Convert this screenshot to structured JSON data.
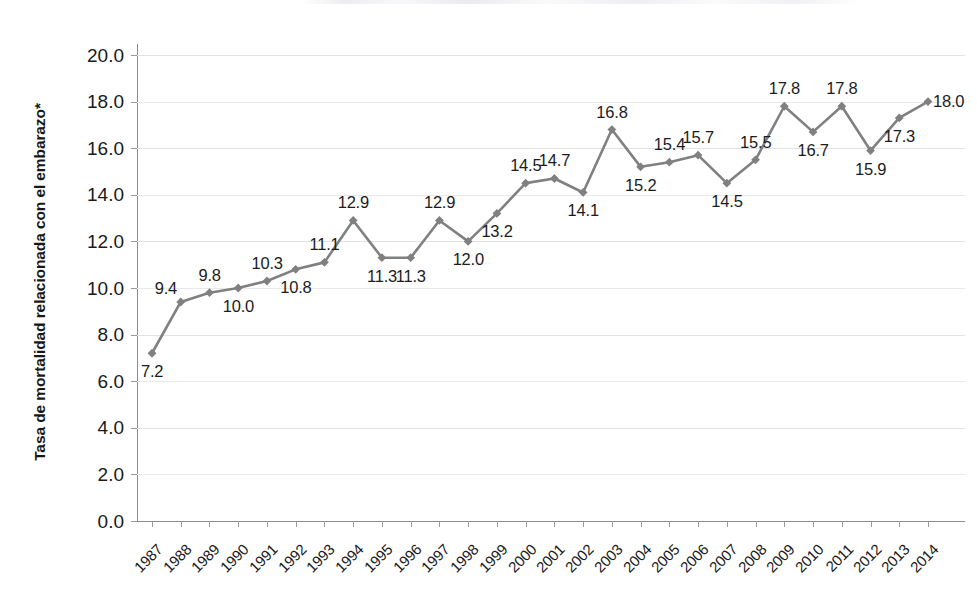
{
  "chart_data": {
    "type": "line",
    "title": "",
    "xlabel": "",
    "ylabel": "Tasa de mortalidad relacionada con el embarazo*",
    "ylim": [
      0.0,
      20.0
    ],
    "ytick_step": 2.0,
    "grid": true,
    "legend": "none",
    "marker": "diamond",
    "series_color": "#808080",
    "label_color": "#1c1c1c",
    "gridline_color": "#e9e9ec",
    "axis_color": "#8c8c8c",
    "categories": [
      "1987",
      "1988",
      "1989",
      "1990",
      "1991",
      "1992",
      "1993",
      "1994",
      "1995",
      "1996",
      "1997",
      "1998",
      "1999",
      "2000",
      "2001",
      "2002",
      "2003",
      "2004",
      "2005",
      "2006",
      "2007",
      "2008",
      "2009",
      "2010",
      "2011",
      "2012",
      "2013",
      "2014"
    ],
    "values": [
      7.2,
      9.4,
      9.8,
      10.0,
      10.3,
      10.8,
      11.1,
      12.9,
      11.3,
      11.3,
      12.9,
      12.0,
      13.2,
      14.5,
      14.7,
      14.1,
      16.8,
      15.2,
      15.4,
      15.7,
      14.5,
      15.5,
      17.8,
      16.7,
      17.8,
      15.9,
      17.3,
      18.0
    ],
    "value_labels": [
      "7.2",
      "9.4",
      "9.8",
      "10.0",
      "10.3",
      "10.8",
      "11.1",
      "12.9",
      "11.3",
      "11.3",
      "12.9",
      "12.0",
      "13.2",
      "14.5",
      "14.7",
      "14.1",
      "16.8",
      "15.2",
      "15.4",
      "15.7",
      "14.5",
      "15.5",
      "17.8",
      "16.7",
      "17.8",
      "15.9",
      "17.3",
      "18.0"
    ],
    "label_positions": [
      "below",
      "left",
      "above",
      "below",
      "above",
      "below",
      "above",
      "above",
      "below",
      "below",
      "above",
      "below",
      "below",
      "above",
      "above",
      "below",
      "above",
      "below",
      "above",
      "above",
      "below",
      "above",
      "above",
      "below",
      "above",
      "below",
      "below",
      "right"
    ],
    "ytick_labels": [
      "20.0",
      "18.0",
      "16.0",
      "14.0",
      "12.0",
      "10.0",
      "8.0",
      "6.0",
      "4.0",
      "2.0",
      "0.0"
    ],
    "ytick_values": [
      20.0,
      18.0,
      16.0,
      14.0,
      12.0,
      10.0,
      8.0,
      6.0,
      4.0,
      2.0,
      0.0
    ]
  }
}
